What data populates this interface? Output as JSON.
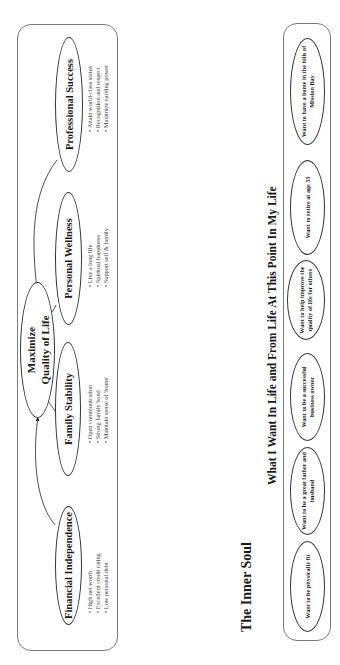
{
  "diagram": {
    "center": {
      "line1": "Maximize",
      "line2": "Quality of Life"
    },
    "pillars": [
      {
        "label": "Financial Independence",
        "bullets": [
          "High net worth",
          "Excellent credit rating",
          "Low personal debt"
        ]
      },
      {
        "label": "Family Stability",
        "bullets": [
          "Open communication",
          "Strong family bond",
          "Maintain sense of 'home'"
        ]
      },
      {
        "label": "Personal Wellness",
        "bullets": [
          "Live a long life",
          "Spiritual happiness",
          "Support self & family"
        ]
      },
      {
        "label": "Professional Success",
        "bullets": [
          "Attain world-class status",
          "Recognition and respect",
          "Maximize earning power"
        ]
      }
    ]
  },
  "section": {
    "title": "The Inner Soul",
    "subtitle": "What I Want In Life and From Life At This Point In My Life",
    "wants": [
      "Want to be physically fit",
      "Want to be a great father and husband",
      "Want to be a successful business owner",
      "Want to help improve the quality of life for others",
      "Want to retire at age 55",
      "Want to have a home in the hills of Mission Bay"
    ]
  },
  "colors": {
    "ink": "#1a1a1a",
    "border": "#7a7a7a",
    "bullet_text": "#444444"
  }
}
